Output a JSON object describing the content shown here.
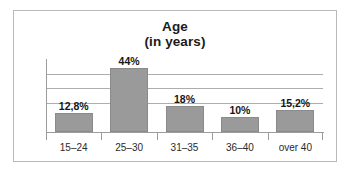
{
  "chart_data": {
    "type": "bar",
    "title": "Age",
    "subtitle": "(in years)",
    "xlabel": "",
    "ylabel": "",
    "categories": [
      "15–24",
      "25–30",
      "31–35",
      "36–40",
      "over 40"
    ],
    "values": [
      12.8,
      44,
      18,
      10,
      15.2
    ],
    "value_labels": [
      "12,8%",
      "44%",
      "18%",
      "10%",
      "15,2%"
    ],
    "ylim": [
      0,
      50
    ],
    "gridlines": [
      40,
      30,
      20
    ],
    "grid": true,
    "legend": "none",
    "bar_color": "#9a9a9a",
    "grid_color": "#adadad",
    "axis_color": "#9c9c9c",
    "border_color": "#b9b9b9"
  }
}
